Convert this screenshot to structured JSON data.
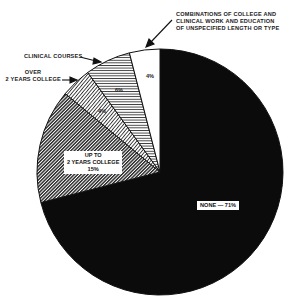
{
  "chart_data": {
    "type": "pie",
    "title": "",
    "start_angle": "12 o'clock, clockwise",
    "slices": [
      {
        "label": "NONE",
        "value": 71,
        "display": "NONE — 71%",
        "pattern": "solid-black"
      },
      {
        "label": "UP TO 2 YEARS COLLEGE",
        "value": 15,
        "display": "15%",
        "pattern": "dense-diagonal-hatch"
      },
      {
        "label": "OVER 2 YEARS COLLEGE",
        "value": 4,
        "display": "4%",
        "pattern": "diagonal-hatch"
      },
      {
        "label": "CLINICAL COURSES",
        "value": 6,
        "display": "6%",
        "pattern": "horizontal-lines"
      },
      {
        "label": "COMBINATIONS OF COLLEGE AND CLINICAL WORK AND EDUCATION OF UNSPECIFIED LENGTH OR TYPE",
        "value": 4,
        "display": "4%",
        "pattern": "white"
      }
    ],
    "legend": "none (callout labels)"
  },
  "labels": {
    "combinations_line1": "COMBINATIONS OF COLLEGE AND",
    "combinations_line2": "CLINICAL WORK AND EDUCATION",
    "combinations_line3": "OF UNSPECIFIED LENGTH OR TYPE",
    "clinical": "CLINICAL COURSES",
    "over_line1": "OVER",
    "over_line2": "2 YEARS COLLEGE",
    "upto_line1": "UP TO",
    "upto_line2": "2 YEARS COLLEGE",
    "upto_pct": "15%",
    "none": "NONE — 71%",
    "over_pct": "4%",
    "clinical_pct": "6%",
    "combinations_pct": "4%"
  }
}
